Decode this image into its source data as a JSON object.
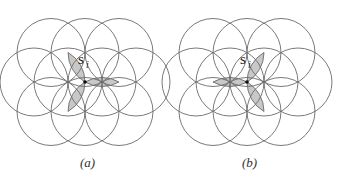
{
  "figure": {
    "panels": [
      {
        "id": "a",
        "caption": "(a)",
        "node_label": "s",
        "node_subscript": "i",
        "center": [
          85,
          82
        ],
        "shaded_petals_toward": [
          "upper-left",
          "right",
          "lower-left"
        ]
      },
      {
        "id": "b",
        "caption": "(b)",
        "node_label": "s",
        "node_subscript": "i",
        "center": [
          247,
          82
        ],
        "shaded_petals_toward": [
          "left",
          "upper-right",
          "lower-right"
        ]
      }
    ],
    "circle_radius": 34,
    "stroke_color": "#6b6b6b",
    "shade_color": "#c8c8c8"
  }
}
